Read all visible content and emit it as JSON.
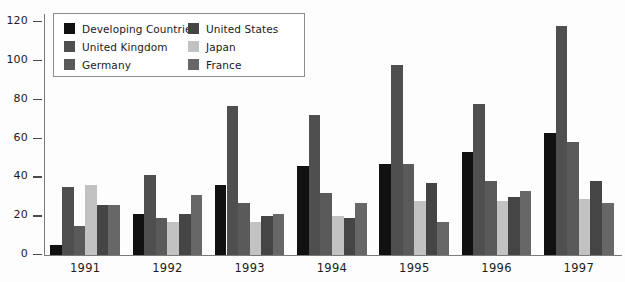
{
  "chart_data": {
    "type": "bar",
    "title": "",
    "subtitle": "",
    "xlabel": "",
    "ylabel": "",
    "categories": [
      "1991",
      "1992",
      "1993",
      "1994",
      "1995",
      "1996",
      "1997"
    ],
    "ylim": [
      0,
      120
    ],
    "ytick_values": [
      0,
      20,
      40,
      60,
      80,
      100,
      120
    ],
    "ytick_labels": [
      "0",
      "20",
      "40",
      "60",
      "80",
      "100",
      "120"
    ],
    "grid": false,
    "legend_position": "upper-left-inside",
    "series": [
      {
        "name": "Developing Countries",
        "color": "#111111",
        "values": [
          5,
          21,
          36,
          46,
          47,
          53,
          63
        ]
      },
      {
        "name": "United Kingdom",
        "color": "#4f4f4f",
        "values": [
          35,
          41,
          77,
          72,
          98,
          78,
          118
        ]
      },
      {
        "name": "Germany",
        "color": "#5a5a5a",
        "values": [
          15,
          19,
          27,
          32,
          47,
          38,
          58
        ]
      },
      {
        "name": "Japan",
        "color": "#c2c2c2",
        "values": [
          36,
          17,
          17,
          20,
          28,
          28,
          29
        ]
      },
      {
        "name": "United States",
        "color": "#454545",
        "values": [
          26,
          21,
          20,
          19,
          37,
          30,
          38
        ]
      },
      {
        "name": "France",
        "color": "#676767",
        "values": [
          26,
          31,
          21,
          27,
          17,
          33,
          27
        ]
      }
    ]
  },
  "legend": {
    "columns": [
      [
        "Developing Countries",
        "United Kingdom",
        "Germany"
      ],
      [
        "United States",
        "Japan",
        "France"
      ]
    ]
  },
  "colors": {
    "background": "#fdfdfd",
    "axis": "#7a7a7a",
    "tick": "#4a4a4a",
    "text": "#1c1c1c",
    "legend_border": "#8d8d8d"
  }
}
